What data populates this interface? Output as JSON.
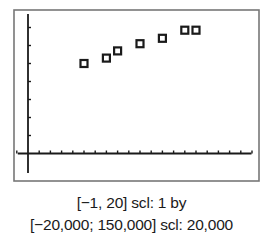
{
  "chart_data": {
    "type": "scatter",
    "title": "",
    "xlabel": "",
    "ylabel": "",
    "xlim": [
      -1,
      20
    ],
    "ylim": [
      -20000,
      150000
    ],
    "xscl": 1,
    "yscl": 20000,
    "grid": false,
    "legend": null,
    "marker": "square",
    "series": [
      {
        "name": "data",
        "points": [
          {
            "x": 5,
            "y": 100000
          },
          {
            "x": 7,
            "y": 106000
          },
          {
            "x": 8,
            "y": 114000
          },
          {
            "x": 10,
            "y": 122000
          },
          {
            "x": 12,
            "y": 128000
          },
          {
            "x": 14,
            "y": 137000
          },
          {
            "x": 15,
            "y": 137000
          }
        ]
      }
    ]
  },
  "caption": {
    "line1": "[−1, 20] scl: 1 by",
    "line2": "[−20,000; 150,000] scl: 20,000"
  },
  "colors": {
    "frame": "#777777",
    "axis": "#1a1a1a",
    "marker": "#1a1a1a",
    "background": "#ffffff"
  }
}
